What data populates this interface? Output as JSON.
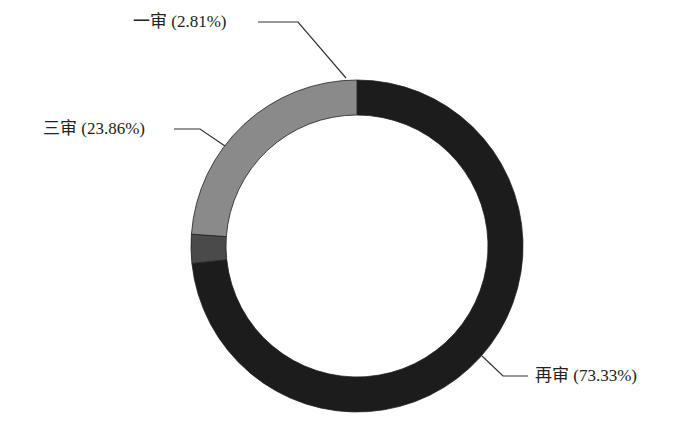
{
  "chart_data": {
    "type": "pie",
    "variant": "donut",
    "title": "",
    "categories": [
      "再审",
      "一审",
      "三审"
    ],
    "values": [
      73.33,
      2.81,
      23.86
    ],
    "labels": [
      "再审 (73.33%)",
      "一审 (2.81%)",
      "三审 (23.86%)"
    ],
    "colors": [
      "#1c1c1c",
      "#4a4a4a",
      "#8a8a8a"
    ],
    "start_angle_deg": 0,
    "direction": "clockwise",
    "legend": "none"
  },
  "labels": {
    "zaishen": "再审 (73.33%)",
    "yishen": "一审 (2.81%)",
    "sanshen": "三审 (23.86%)"
  }
}
